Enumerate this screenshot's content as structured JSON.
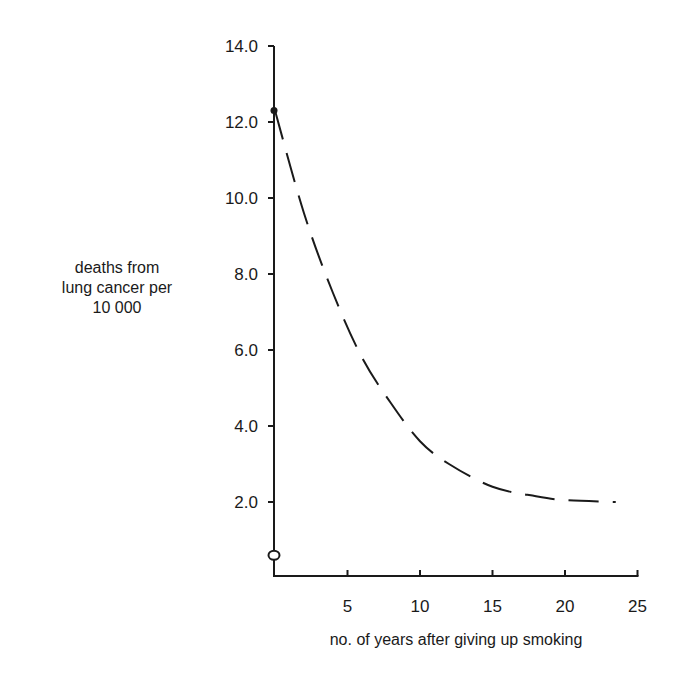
{
  "chart_data": {
    "type": "line",
    "title": "",
    "xlabel": "no. of years after giving up smoking",
    "ylabel_lines": [
      "deaths from",
      "lung cancer per",
      "10 000"
    ],
    "ylabel": "deaths from lung cancer per 10 000",
    "xlim": [
      0,
      25
    ],
    "ylim": [
      0,
      14
    ],
    "x_ticks": [
      "5",
      "10",
      "15",
      "20",
      "25"
    ],
    "y_ticks": [
      "2.0",
      "4.0",
      "6.0",
      "8.0",
      "10.0",
      "12.0",
      "14.0"
    ],
    "grid": false,
    "legend": null,
    "series": [
      {
        "name": "ex-smokers (dashed curve)",
        "style": "dashed",
        "x": [
          0,
          2,
          4,
          6,
          8,
          10,
          12,
          15,
          18,
          20,
          23.5
        ],
        "y": [
          12.3,
          9.6,
          7.5,
          5.8,
          4.6,
          3.6,
          3.0,
          2.4,
          2.15,
          2.05,
          2.0
        ]
      }
    ],
    "markers": [
      {
        "name": "smokers at year 0",
        "shape": "filled-circle",
        "x": 0,
        "y": 12.3
      },
      {
        "name": "non-smokers",
        "shape": "open-circle",
        "x": 0,
        "y": 0.6
      }
    ]
  },
  "labels": {
    "x_axis_title": "no. of years after giving up smoking",
    "y_axis_title": [
      "deaths from",
      "lung cancer per",
      "10 000"
    ]
  }
}
